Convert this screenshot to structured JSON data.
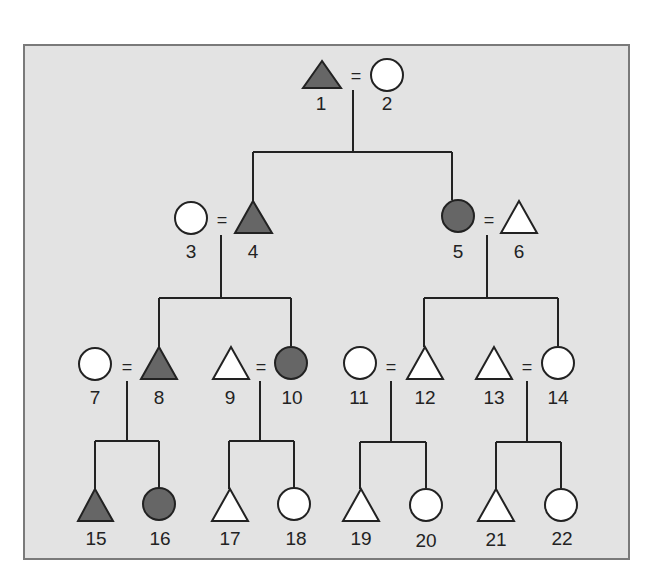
{
  "diagram": {
    "type": "pedigree",
    "colors": {
      "panel_fill": "#e3e3e3",
      "panel_border": "#7a7a7a",
      "affected_fill": "#666666",
      "unaffected_fill": "#ffffff",
      "line": "#222222"
    },
    "marriage_symbol": "=",
    "individuals": [
      {
        "id": "1",
        "label": "1",
        "shape": "triangle",
        "affected": true,
        "generation": 1
      },
      {
        "id": "2",
        "label": "2",
        "shape": "circle",
        "affected": false,
        "generation": 1
      },
      {
        "id": "3",
        "label": "3",
        "shape": "circle",
        "affected": false,
        "generation": 2
      },
      {
        "id": "4",
        "label": "4",
        "shape": "triangle",
        "affected": true,
        "generation": 2
      },
      {
        "id": "5",
        "label": "5",
        "shape": "circle",
        "affected": true,
        "generation": 2
      },
      {
        "id": "6",
        "label": "6",
        "shape": "triangle",
        "affected": false,
        "generation": 2
      },
      {
        "id": "7",
        "label": "7",
        "shape": "circle",
        "affected": false,
        "generation": 3
      },
      {
        "id": "8",
        "label": "8",
        "shape": "triangle",
        "affected": true,
        "generation": 3
      },
      {
        "id": "9",
        "label": "9",
        "shape": "triangle",
        "affected": false,
        "generation": 3
      },
      {
        "id": "10",
        "label": "10",
        "shape": "circle",
        "affected": true,
        "generation": 3
      },
      {
        "id": "11",
        "label": "11",
        "shape": "circle",
        "affected": false,
        "generation": 3
      },
      {
        "id": "12",
        "label": "12",
        "shape": "triangle",
        "affected": false,
        "generation": 3
      },
      {
        "id": "13",
        "label": "13",
        "shape": "triangle",
        "affected": false,
        "generation": 3
      },
      {
        "id": "14",
        "label": "14",
        "shape": "circle",
        "affected": false,
        "generation": 3
      },
      {
        "id": "15",
        "label": "15",
        "shape": "triangle",
        "affected": true,
        "generation": 4
      },
      {
        "id": "16",
        "label": "16",
        "shape": "circle",
        "affected": true,
        "generation": 4
      },
      {
        "id": "17",
        "label": "17",
        "shape": "triangle",
        "affected": false,
        "generation": 4
      },
      {
        "id": "18",
        "label": "18",
        "shape": "circle",
        "affected": false,
        "generation": 4
      },
      {
        "id": "19",
        "label": "19",
        "shape": "triangle",
        "affected": false,
        "generation": 4
      },
      {
        "id": "20",
        "label": "20",
        "shape": "circle",
        "affected": false,
        "generation": 4
      },
      {
        "id": "21",
        "label": "21",
        "shape": "triangle",
        "affected": false,
        "generation": 4
      },
      {
        "id": "22",
        "label": "22",
        "shape": "circle",
        "affected": false,
        "generation": 4
      }
    ],
    "couples": [
      {
        "partners": [
          "1",
          "2"
        ],
        "children": [
          "4",
          "5"
        ]
      },
      {
        "partners": [
          "3",
          "4"
        ],
        "children": [
          "8",
          "10"
        ]
      },
      {
        "partners": [
          "5",
          "6"
        ],
        "children": [
          "12",
          "14"
        ]
      },
      {
        "partners": [
          "7",
          "8"
        ],
        "children": [
          "15",
          "16"
        ]
      },
      {
        "partners": [
          "9",
          "10"
        ],
        "children": [
          "17",
          "18"
        ]
      },
      {
        "partners": [
          "11",
          "12"
        ],
        "children": [
          "19",
          "20"
        ]
      },
      {
        "partners": [
          "13",
          "14"
        ],
        "children": [
          "21",
          "22"
        ]
      }
    ]
  }
}
